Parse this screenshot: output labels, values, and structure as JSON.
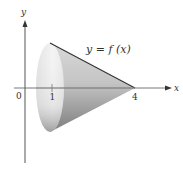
{
  "diagram": {
    "title": "",
    "axes": {
      "x_label": "x",
      "y_label": "y",
      "origin_label": "0"
    },
    "ticks": {
      "tick_1": "1",
      "tick_4": "4"
    },
    "curve_label": "y = f (x)",
    "shape": "cone",
    "colors": {
      "axis": "#444444",
      "cone_light": "#f2f2f2",
      "cone_dark": "#8a8a8a",
      "edge": "#333333"
    }
  }
}
